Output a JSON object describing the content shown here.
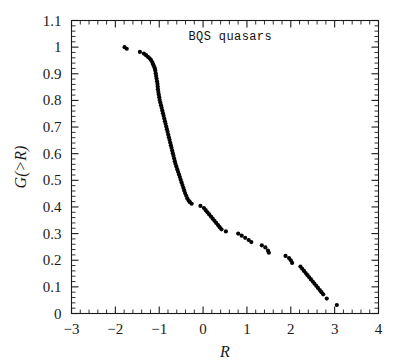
{
  "figure": {
    "background_color": "#ffffff",
    "foreground_color": "#1a1a1a",
    "point_color": "#050505"
  },
  "annotation": {
    "label": "BQS quasars",
    "x_data": 0.62,
    "y_data": 1.028
  },
  "chart_data": {
    "type": "scatter",
    "title": "",
    "subtitle": "",
    "xlabel": "R",
    "ylabel": "G(>R)",
    "xlim": [
      -3,
      4
    ],
    "ylim": [
      0,
      1.1
    ],
    "grid": false,
    "legend": null,
    "x_major_ticks": [
      -3,
      -2,
      -1,
      0,
      1,
      2,
      3,
      4
    ],
    "x_major_tick_labels": [
      "−3",
      "−2",
      "−1",
      "0",
      "1",
      "2",
      "3",
      "4"
    ],
    "x_minor_tick_step": 0.2,
    "y_major_ticks": [
      0,
      0.1,
      0.2,
      0.3,
      0.4,
      0.5,
      0.6,
      0.7,
      0.8,
      0.9,
      1.0,
      1.1
    ],
    "y_major_tick_labels": [
      "0",
      "0.1",
      "0.2",
      "0.3",
      "0.4",
      "0.5",
      "0.6",
      "0.7",
      "0.8",
      "0.9",
      "1",
      "1.1"
    ],
    "y_minor_tick_step": 0.02,
    "ticks_direction": "in",
    "marker": "filled-circle",
    "marker_size_px": 3.0,
    "annotations": [
      {
        "text": "BQS quasars",
        "x": 0.62,
        "y": 1.028
      }
    ],
    "series": [
      {
        "name": "BQS quasars cumulative distribution",
        "points": [
          [
            -1.79,
            1.0
          ],
          [
            -1.74,
            0.994
          ],
          [
            -1.44,
            0.982
          ],
          [
            -1.35,
            0.976
          ],
          [
            -1.3,
            0.97
          ],
          [
            -1.26,
            0.964
          ],
          [
            -1.22,
            0.958
          ],
          [
            -1.19,
            0.952
          ],
          [
            -1.16,
            0.944
          ],
          [
            -1.14,
            0.936
          ],
          [
            -1.12,
            0.928
          ],
          [
            -1.1,
            0.92
          ],
          [
            -1.09,
            0.912
          ],
          [
            -1.08,
            0.902
          ],
          [
            -1.07,
            0.892
          ],
          [
            -1.06,
            0.882
          ],
          [
            -1.05,
            0.872
          ],
          [
            -1.04,
            0.862
          ],
          [
            -1.035,
            0.852
          ],
          [
            -1.03,
            0.842
          ],
          [
            -1.02,
            0.832
          ],
          [
            -1.01,
            0.822
          ],
          [
            -1.0,
            0.812
          ],
          [
            -0.99,
            0.802
          ],
          [
            -0.975,
            0.792
          ],
          [
            -0.96,
            0.782
          ],
          [
            -0.945,
            0.772
          ],
          [
            -0.93,
            0.762
          ],
          [
            -0.915,
            0.752
          ],
          [
            -0.9,
            0.742
          ],
          [
            -0.885,
            0.732
          ],
          [
            -0.87,
            0.722
          ],
          [
            -0.855,
            0.712
          ],
          [
            -0.84,
            0.702
          ],
          [
            -0.825,
            0.692
          ],
          [
            -0.81,
            0.682
          ],
          [
            -0.795,
            0.672
          ],
          [
            -0.78,
            0.662
          ],
          [
            -0.765,
            0.652
          ],
          [
            -0.75,
            0.642
          ],
          [
            -0.735,
            0.632
          ],
          [
            -0.72,
            0.622
          ],
          [
            -0.705,
            0.612
          ],
          [
            -0.69,
            0.602
          ],
          [
            -0.675,
            0.592
          ],
          [
            -0.66,
            0.582
          ],
          [
            -0.645,
            0.572
          ],
          [
            -0.63,
            0.562
          ],
          [
            -0.61,
            0.552
          ],
          [
            -0.59,
            0.542
          ],
          [
            -0.57,
            0.532
          ],
          [
            -0.55,
            0.522
          ],
          [
            -0.53,
            0.512
          ],
          [
            -0.51,
            0.502
          ],
          [
            -0.49,
            0.492
          ],
          [
            -0.47,
            0.482
          ],
          [
            -0.45,
            0.472
          ],
          [
            -0.43,
            0.462
          ],
          [
            -0.41,
            0.452
          ],
          [
            -0.385,
            0.442
          ],
          [
            -0.36,
            0.432
          ],
          [
            -0.33,
            0.424
          ],
          [
            -0.3,
            0.418
          ],
          [
            -0.26,
            0.412
          ],
          [
            -0.06,
            0.404
          ],
          [
            0.02,
            0.396
          ],
          [
            0.06,
            0.388
          ],
          [
            0.1,
            0.38
          ],
          [
            0.14,
            0.372
          ],
          [
            0.18,
            0.364
          ],
          [
            0.22,
            0.356
          ],
          [
            0.26,
            0.348
          ],
          [
            0.3,
            0.34
          ],
          [
            0.34,
            0.332
          ],
          [
            0.38,
            0.324
          ],
          [
            0.42,
            0.316
          ],
          [
            0.52,
            0.308
          ],
          [
            0.8,
            0.3
          ],
          [
            0.88,
            0.292
          ],
          [
            0.96,
            0.284
          ],
          [
            1.04,
            0.276
          ],
          [
            1.1,
            0.268
          ],
          [
            1.34,
            0.256
          ],
          [
            1.42,
            0.248
          ],
          [
            1.48,
            0.236
          ],
          [
            1.5,
            0.228
          ],
          [
            1.88,
            0.216
          ],
          [
            1.96,
            0.208
          ],
          [
            2.0,
            0.2
          ],
          [
            2.03,
            0.19
          ],
          [
            2.22,
            0.176
          ],
          [
            2.26,
            0.168
          ],
          [
            2.3,
            0.16
          ],
          [
            2.34,
            0.152
          ],
          [
            2.38,
            0.144
          ],
          [
            2.42,
            0.136
          ],
          [
            2.46,
            0.128
          ],
          [
            2.5,
            0.12
          ],
          [
            2.54,
            0.112
          ],
          [
            2.58,
            0.104
          ],
          [
            2.62,
            0.096
          ],
          [
            2.66,
            0.088
          ],
          [
            2.7,
            0.08
          ],
          [
            2.74,
            0.072
          ],
          [
            2.82,
            0.056
          ],
          [
            3.05,
            0.032
          ]
        ]
      }
    ]
  }
}
